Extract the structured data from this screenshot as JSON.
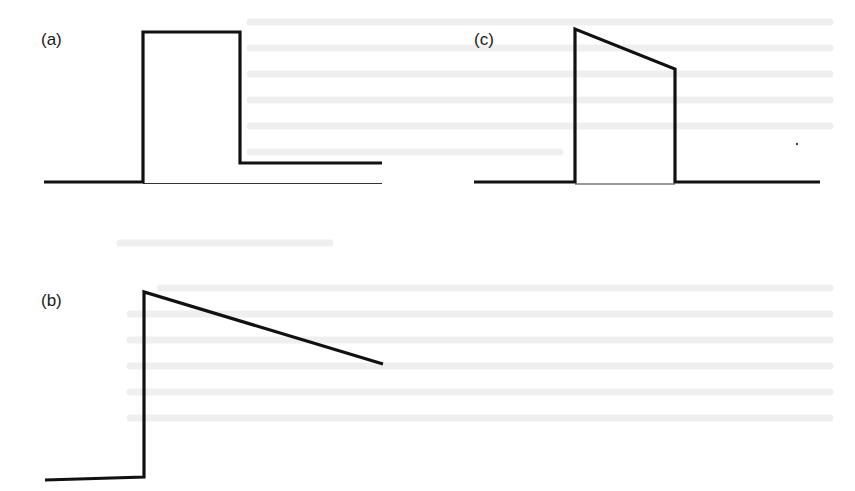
{
  "figure": {
    "panels": [
      {
        "id": "a",
        "label": "(a)",
        "shape": "rectangular pulse with elevated tail",
        "waveform": [
          [
            44,
            182
          ],
          [
            143,
            182
          ],
          [
            143,
            32
          ],
          [
            240,
            32
          ],
          [
            240,
            163
          ],
          [
            382,
            163
          ]
        ],
        "axis": [
          [
            143,
            183
          ],
          [
            382,
            183
          ]
        ]
      },
      {
        "id": "b",
        "label": "(b)",
        "shape": "step rise followed by linear decay",
        "waveform": [
          [
            45,
            480
          ],
          [
            144,
            477
          ],
          [
            144,
            292
          ],
          [
            383,
            364
          ]
        ]
      },
      {
        "id": "c",
        "label": "(c)",
        "shape": "trapezoidal pulse with sloped top returning to baseline",
        "waveform": [
          [
            474,
            182
          ],
          [
            575,
            182
          ],
          [
            575,
            29
          ],
          [
            675,
            69
          ],
          [
            675,
            182
          ],
          [
            820,
            182
          ]
        ],
        "axis": [
          [
            575,
            184
          ],
          [
            675,
            184
          ]
        ]
      }
    ],
    "stroke_color": "#111111",
    "background": "#ffffff"
  }
}
